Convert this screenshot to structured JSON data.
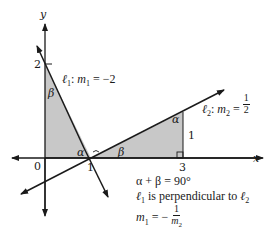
{
  "diagram": {
    "axes": {
      "x_label": "x",
      "y_label": "y",
      "origin_label": "0",
      "x_ticks": [
        "1",
        "3"
      ],
      "y_ticks": [
        "2"
      ]
    },
    "lines": [
      {
        "id": "l1",
        "name": "ℓ",
        "subscript": "1",
        "slope_label": "m",
        "slope_subscript": "1",
        "slope_value": "= −2"
      },
      {
        "id": "l2",
        "name": "ℓ",
        "subscript": "2",
        "slope_label": "m",
        "slope_subscript": "2",
        "slope_num": "1",
        "slope_den": "2"
      }
    ],
    "triangles": [
      {
        "id": "left-triangle",
        "vertices": [
          [
            0,
            2
          ],
          [
            0,
            0
          ],
          [
            1,
            0
          ]
        ],
        "angle_top": "β",
        "angle_bottom_right": "α"
      },
      {
        "id": "right-triangle",
        "vertices": [
          [
            1,
            0
          ],
          [
            3,
            0
          ],
          [
            3,
            1
          ]
        ],
        "angle_left": "β",
        "angle_top": "α",
        "side_label": "1"
      }
    ],
    "angle_labels": {
      "alpha": "α",
      "beta": "β"
    },
    "notes": {
      "line1": "α + β = 90°",
      "line2_prefix": "ℓ",
      "line2_sub1": "1",
      "line2_mid": " is perpendicular to ",
      "line2_l": "ℓ",
      "line2_sub2": "2",
      "line3_lhs": "m",
      "line3_lhs_sub": "1",
      "line3_eq": " = −",
      "line3_num": "1",
      "line3_den_m": "m",
      "line3_den_sub": "2"
    },
    "colors": {
      "shade": "#c8c8c8",
      "ink": "#1a1a1a"
    }
  }
}
